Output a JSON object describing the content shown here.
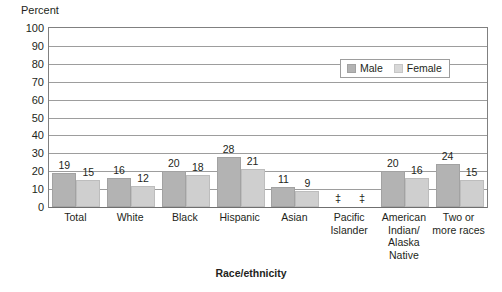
{
  "chart_data": {
    "type": "bar",
    "title": "",
    "xlabel": "Race/ethnicity",
    "ylabel": "Percent",
    "ylim": [
      0,
      100
    ],
    "ytick_step": 10,
    "yticks": [
      "100",
      "90",
      "80",
      "70",
      "60",
      "50",
      "40",
      "30",
      "20",
      "10",
      "0"
    ],
    "grid": true,
    "legend_position": "inside-top-right",
    "categories": [
      "Total",
      "White",
      "Black",
      "Hispanic",
      "Asian",
      "Pacific Islander",
      "American Indian/ Alaska Native",
      "Two or more races"
    ],
    "category_lines": [
      [
        "Total"
      ],
      [
        "White"
      ],
      [
        "Black"
      ],
      [
        "Hispanic"
      ],
      [
        "Asian"
      ],
      [
        "Pacific",
        "Islander"
      ],
      [
        "American",
        "Indian/",
        "Alaska",
        "Native"
      ],
      [
        "Two or",
        "more races"
      ]
    ],
    "series": [
      {
        "name": "Male",
        "color": "#b3b3b3",
        "values": [
          19,
          16,
          20,
          28,
          11,
          null,
          20,
          24
        ],
        "labels": [
          "19",
          "16",
          "20",
          "28",
          "11",
          "‡",
          "20",
          "24"
        ]
      },
      {
        "name": "Female",
        "color": "#cfcfcf",
        "values": [
          15,
          12,
          18,
          21,
          9,
          null,
          16,
          15
        ],
        "labels": [
          "15",
          "12",
          "18",
          "21",
          "9",
          "‡",
          "16",
          "15"
        ]
      }
    ],
    "suppressed_symbol": "‡",
    "suppressed_categories": [
      "Pacific Islander"
    ]
  },
  "legend": {
    "items": [
      {
        "label": "Male"
      },
      {
        "label": "Female"
      }
    ]
  },
  "colors": {
    "male": "#b3b3b3",
    "female": "#cfcfcf",
    "grid": "#9d9d9d",
    "frame": "#808080",
    "text": "#231f20"
  }
}
